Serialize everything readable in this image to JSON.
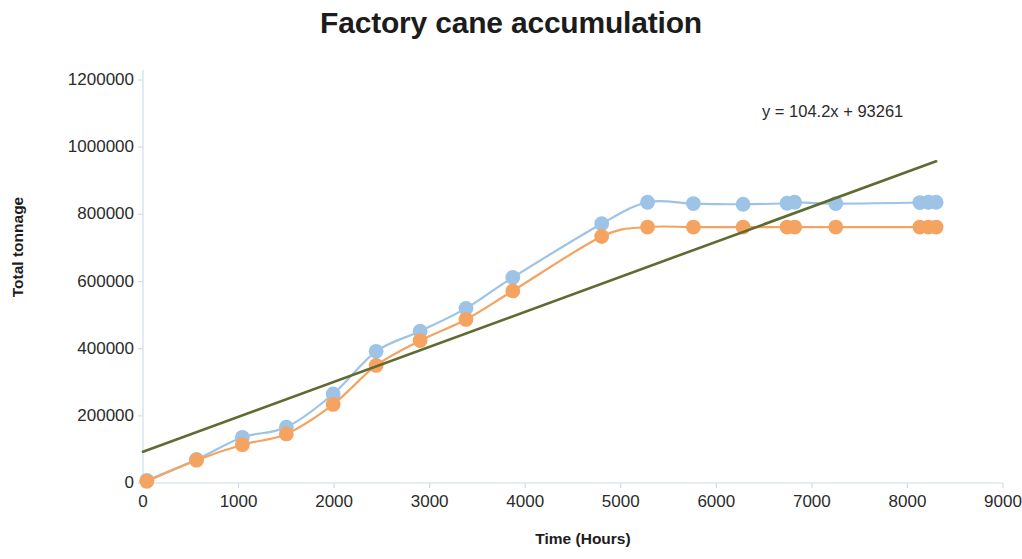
{
  "chart_data": {
    "type": "line",
    "title": "Factory cane accumulation",
    "xlabel": "Time (Hours)",
    "ylabel": "Total tonnage",
    "xlim": [
      0,
      9000
    ],
    "ylim": [
      0,
      1200000
    ],
    "xticks": [
      0,
      1000,
      2000,
      3000,
      4000,
      5000,
      6000,
      7000,
      8000,
      9000
    ],
    "xtick_labels": [
      "0",
      "1000",
      "2000",
      "3000",
      "4000",
      "5000",
      "6000",
      "7000",
      "8000",
      "9000"
    ],
    "yticks": [
      0,
      200000,
      400000,
      600000,
      800000,
      1000000,
      1200000
    ],
    "ytick_labels": [
      "0",
      "200000",
      "400000",
      "600000",
      "800000",
      "1000000",
      "1200000"
    ],
    "grid": false,
    "legend": "none",
    "annotations": [
      {
        "name": "trendline-equation",
        "text": "y = 104.2x + 93261",
        "x": 6750,
        "y": 1095000
      }
    ],
    "series": [
      {
        "name": "series-blue",
        "color": "#9DC3E6",
        "marker": "circle",
        "x": [
          40,
          560,
          1040,
          1500,
          1990,
          2440,
          2900,
          3380,
          3870,
          4800,
          5280,
          5760,
          6280,
          6740,
          6820,
          7250,
          8130,
          8220,
          8300
        ],
        "y": [
          8000,
          70000,
          136000,
          166000,
          265000,
          392000,
          452000,
          520000,
          612000,
          772000,
          836000,
          832000,
          830000,
          833000,
          836000,
          832000,
          835000,
          836000,
          836000
        ]
      },
      {
        "name": "series-orange",
        "color": "#F4A460",
        "marker": "circle",
        "x": [
          40,
          560,
          1040,
          1500,
          1990,
          2440,
          2900,
          3380,
          3870,
          4800,
          5280,
          5760,
          6280,
          6740,
          6820,
          7250,
          8130,
          8220,
          8300
        ],
        "y": [
          5000,
          68000,
          114000,
          146000,
          234000,
          350000,
          424000,
          487000,
          572000,
          734000,
          762000,
          762000,
          762000,
          762000,
          762000,
          762000,
          762000,
          762000,
          762000
        ]
      },
      {
        "name": "trendline-linear",
        "color": "#5F6B31",
        "marker": "none",
        "equation": "y = 104.2x + 93261",
        "slope": 104.2,
        "intercept": 93261,
        "x": [
          0,
          8300
        ],
        "y": [
          93261,
          958121
        ]
      }
    ]
  }
}
